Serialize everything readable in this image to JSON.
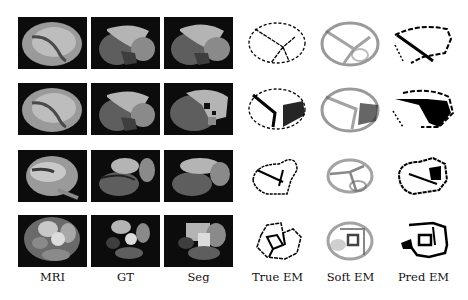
{
  "figure": {
    "columns": [
      {
        "key": "mri",
        "label": "MRI"
      },
      {
        "key": "gt",
        "label": "GT"
      },
      {
        "key": "seg",
        "label": "Seg"
      },
      {
        "key": "true_em",
        "label": "True EM"
      },
      {
        "key": "soft_em",
        "label": "Soft EM"
      },
      {
        "key": "pred_em",
        "label": "Pred EM"
      }
    ],
    "rows": 4,
    "colors": {
      "background": "#ffffff",
      "panel_bg": "#0c0c0c",
      "region_light": "#b4b4b4",
      "region_mid": "#8a8a8a",
      "region_dark": "#5e5e5e",
      "region_darker": "#3e3e3e",
      "edge_map": "#000000"
    }
  }
}
